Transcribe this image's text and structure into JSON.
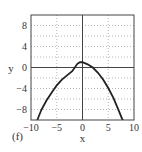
{
  "chart_data": {
    "type": "line",
    "title": "",
    "panel_label": "(f)",
    "xlabel": "x",
    "ylabel": "y",
    "xlim": [
      -10,
      10
    ],
    "ylim": [
      -10,
      10
    ],
    "xticks": [
      -10,
      -5,
      0,
      5,
      10
    ],
    "xtick_labels": [
      "−10",
      "−5",
      "0",
      "5",
      "10"
    ],
    "yticks": [
      -8,
      -4,
      0,
      4,
      8
    ],
    "ytick_labels": [
      "−8",
      "−4",
      "0",
      "4",
      "8"
    ],
    "grid": true,
    "series": [
      {
        "name": "curve",
        "color": "#222222",
        "x": [
          -10,
          -9,
          -8.7,
          -8,
          -7,
          -6,
          -5,
          -4,
          -3,
          -2,
          -1,
          -0.5,
          0,
          1,
          2,
          3,
          4,
          5,
          6,
          7,
          7.7,
          8,
          9,
          10
        ],
        "y": [
          -13.6,
          -10.6,
          -9.8,
          -8.1,
          -6.3,
          -4.8,
          -3.4,
          -2.3,
          -1.5,
          -0.7,
          0.7,
          1.0,
          1.0,
          0.6,
          0.0,
          -1.0,
          -2.3,
          -3.9,
          -5.8,
          -8.1,
          -9.8,
          -10.2,
          -12.6,
          -15.2
        ]
      }
    ]
  }
}
